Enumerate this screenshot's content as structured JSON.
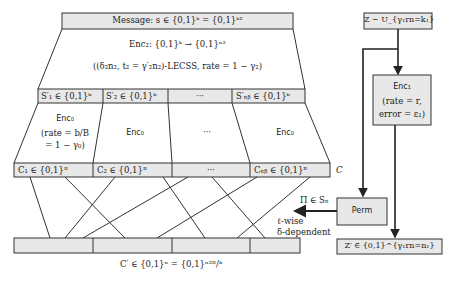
{
  "message_box": {
    "label": "Message: s ∈ {0,1}ᵏ = {0,1}ᵏ²"
  },
  "enc2": {
    "title": "Enc₂: {0,1}ᵏ → {0,1}ⁿ²",
    "subtitle": "((δ₂n₂, t₂ = γ′₂n₂)-LECSS, rate = 1 − γ₂)"
  },
  "s_row": {
    "cells": [
      "S′₁ ∈ {0,1}ᵇ",
      "S′₂ ∈ {0,1}ᵇ",
      "···",
      "S′ₙᵦ ∈ {0,1}ᵇ"
    ]
  },
  "enc0_row": {
    "cells": [
      {
        "title": "Enc₀",
        "line1": "(rate = b/B",
        "line2": "= 1 − γ₀)"
      },
      {
        "title": "Enc₀"
      },
      {
        "title": "···"
      },
      {
        "title": "Enc₀"
      }
    ]
  },
  "c_row": {
    "cells": [
      "C₁ ∈ {0,1}ᴮ",
      "C₂ ∈ {0,1}ᴮ",
      "···",
      "Cₙᵦ ∈ {0,1}ᴮ"
    ],
    "side_label": "C"
  },
  "c_prime_row": {
    "label": "C′ ∈ {0,1}ⁿ = {0,1}ⁿ²ᴮ/ᵇ"
  },
  "z_box": {
    "label": "Z ∼ U_{γ₁rn=k₁}"
  },
  "enc1": {
    "title": "Enc₁",
    "line1": "(rate = r,",
    "line2": "error = ε₁)"
  },
  "perm": {
    "label": "Perm"
  },
  "perm_arrow": {
    "top_label": "Π ∈ Sₙ",
    "bottom_line1": "ℓ-wise",
    "bottom_line2": "δ-dependent"
  },
  "z_prime_box": {
    "label": "Z′ ∈ {0,1}^{γ₁rn=n₁}"
  },
  "colors": {
    "box_fill": "#e8e8e8",
    "stroke": "#333333",
    "background": "#ffffff"
  },
  "permutation_lines": [
    {
      "top_x": 30,
      "bottom_x": 50
    },
    {
      "top_x": 65,
      "bottom_x": 125
    },
    {
      "top_x": 115,
      "bottom_x": 65
    },
    {
      "top_x": 163,
      "bottom_x": 205
    },
    {
      "top_x": 188,
      "bottom_x": 83
    },
    {
      "top_x": 212,
      "bottom_x": 265
    },
    {
      "top_x": 257,
      "bottom_x": 157
    },
    {
      "top_x": 310,
      "bottom_x": 237
    }
  ]
}
